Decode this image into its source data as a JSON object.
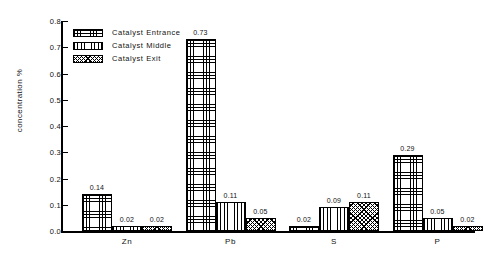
{
  "chart_data": {
    "type": "bar",
    "title": "",
    "xlabel": "",
    "ylabel": "concentration %",
    "ylim": [
      0.0,
      0.8
    ],
    "yticks": [
      "0.0",
      "0.1",
      "0.2",
      "0.3",
      "0.4",
      "0.5",
      "0.6",
      "0.7",
      "0.8"
    ],
    "grid": false,
    "legend_position": "top-left",
    "categories": [
      "Zn",
      "Pb",
      "S",
      "P"
    ],
    "series": [
      {
        "name": "Catalyst Entrance",
        "pattern": "grid",
        "values": [
          0.14,
          0.73,
          0.02,
          0.29
        ],
        "labels": [
          "0.14",
          "0.73",
          "0.02",
          "0.29"
        ]
      },
      {
        "name": "Catalyst Middle",
        "pattern": "vertical-lines",
        "values": [
          0.02,
          0.11,
          0.09,
          0.05
        ],
        "labels": [
          "0.02",
          "0.11",
          "0.09",
          "0.05"
        ]
      },
      {
        "name": "Catalyst Exit",
        "pattern": "dots",
        "values": [
          0.02,
          0.05,
          0.11,
          0.02
        ],
        "labels": [
          "0.02",
          "0.05",
          "0.11",
          "0.02"
        ]
      }
    ]
  },
  "colors": {
    "axis": "#000000",
    "ink": "#111111",
    "background": "#ffffff"
  }
}
